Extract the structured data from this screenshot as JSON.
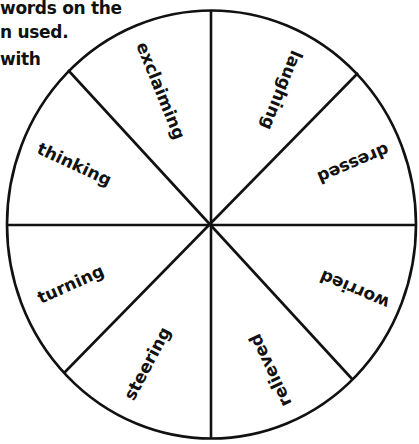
{
  "instructions": {
    "lines": [
      "words on the",
      "n used.",
      "with"
    ]
  },
  "wheel": {
    "line_color": "#111111",
    "background": "#ffffff",
    "segments": [
      {
        "label": "exclaiming"
      },
      {
        "label": "laughing"
      },
      {
        "label": "dressed"
      },
      {
        "label": "worried"
      },
      {
        "label": "relieved"
      },
      {
        "label": "steering"
      },
      {
        "label": "turning"
      },
      {
        "label": "thinking"
      }
    ]
  }
}
